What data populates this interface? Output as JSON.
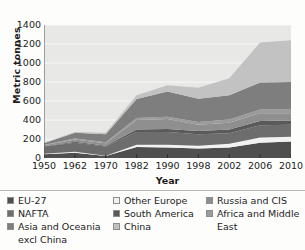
{
  "chart_data": {
    "type": "area",
    "stacked": true,
    "title": "",
    "xlabel": "Year",
    "ylabel": "Metric tonnes",
    "x": [
      1950,
      1962,
      1970,
      1982,
      1990,
      1998,
      2002,
      2006,
      2010
    ],
    "categories": [
      "1950",
      "1962",
      "1970",
      "1982",
      "1990",
      "1998",
      "2002",
      "2006",
      "2010"
    ],
    "ylim": [
      0,
      1400
    ],
    "yticks": [
      0,
      200,
      400,
      600,
      800,
      1000,
      1200,
      1400
    ],
    "ytick_labels": [
      "0",
      "200",
      "400",
      "600",
      "800",
      "1000",
      "1200",
      "1400"
    ],
    "grid": true,
    "grid_axis": "y",
    "legend_position": "bottom",
    "legend_columns": 3,
    "series": [
      {
        "name": "EU-27",
        "color": "#4f4f4f",
        "values": [
          40,
          55,
          20,
          115,
          110,
          100,
          110,
          160,
          175
        ]
      },
      {
        "name": "Other Europe",
        "color": "#f2f2f2",
        "values": [
          5,
          10,
          5,
          25,
          30,
          30,
          40,
          55,
          50
        ]
      },
      {
        "name": "NAFTA",
        "color": "#6d6d6d",
        "values": [
          75,
          95,
          95,
          135,
          135,
          120,
          110,
          130,
          125
        ]
      },
      {
        "name": "South America",
        "color": "#5a5a5a",
        "values": [
          5,
          10,
          10,
          25,
          30,
          35,
          40,
          45,
          45
        ]
      },
      {
        "name": "Russia and CIS",
        "color": "#8f8f8f",
        "values": [
          10,
          25,
          25,
          100,
          105,
          65,
          70,
          80,
          75
        ]
      },
      {
        "name": "Africa and Middle East",
        "color": "#9b9b9b",
        "values": [
          5,
          10,
          10,
          20,
          25,
          30,
          35,
          40,
          40
        ]
      },
      {
        "name": "Asia and Oceania excl China",
        "color": "#7e7e7e",
        "values": [
          15,
          60,
          85,
          200,
          265,
          245,
          255,
          285,
          290
        ]
      },
      {
        "name": "China",
        "color": "#c2c2c2",
        "values": [
          5,
          10,
          15,
          40,
          65,
          115,
          180,
          420,
          440
        ]
      }
    ],
    "series_totals": [
      160,
      275,
      265,
      660,
      765,
      740,
      840,
      1215,
      1240
    ]
  },
  "axes": {
    "y_label": "Metric tonnes",
    "x_label": "Year"
  },
  "legend": {
    "columns": [
      [
        {
          "label": "EU-27",
          "color": "#4f4f4f",
          "continuation": ""
        },
        {
          "label": "NAFTA",
          "color": "#6d6d6d",
          "continuation": ""
        },
        {
          "label": "Asia and Oceania",
          "color": "#7e7e7e",
          "continuation": "excl China"
        }
      ],
      [
        {
          "label": "Other Europe",
          "color": "#f2f2f2",
          "continuation": ""
        },
        {
          "label": "South America",
          "color": "#5a5a5a",
          "continuation": ""
        },
        {
          "label": "China",
          "color": "#c2c2c2",
          "continuation": ""
        }
      ],
      [
        {
          "label": "Russia and CIS",
          "color": "#8f8f8f",
          "continuation": ""
        },
        {
          "label": "Africa and Middle",
          "color": "#9b9b9b",
          "continuation": "East"
        }
      ]
    ]
  }
}
